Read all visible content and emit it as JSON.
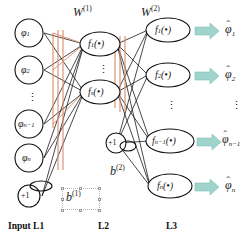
{
  "diagram": {
    "background": "#ffffff",
    "arrow_color": "#9fd4cc",
    "highlight_color": "#d98a6a",
    "edge_color": "#1a1a1a",
    "node_stroke": "#111111"
  },
  "weights": {
    "w1": {
      "base": "W",
      "sup": "(1)"
    },
    "w2": {
      "base": "W",
      "sup": "(2)"
    }
  },
  "biases": {
    "b1": {
      "base": "b",
      "sup": "(1)",
      "selected": true
    },
    "b2": {
      "base": "b",
      "sup": "(2)",
      "selected": false
    },
    "bias_value": "+1"
  },
  "layers": [
    {
      "id": "L1",
      "label": "Input L1",
      "nodes": [
        {
          "base": "φ",
          "sub": "1",
          "shape": "circle"
        },
        {
          "base": "φ",
          "sub": "2",
          "shape": "circle"
        },
        {
          "base": "⋮",
          "sub": "",
          "shape": "dots"
        },
        {
          "base": "φ",
          "sub": "n−1",
          "shape": "circle"
        },
        {
          "base": "φ",
          "sub": "n",
          "shape": "circle"
        },
        {
          "base": "+1",
          "sub": "",
          "shape": "circle-bias"
        }
      ]
    },
    {
      "id": "L2",
      "label": "L2",
      "nodes": [
        {
          "base": "f",
          "sub": "1",
          "arg": "(•)",
          "shape": "ellipse"
        },
        {
          "base": "⋮",
          "sub": "",
          "shape": "dots"
        },
        {
          "base": "f",
          "sub": "s",
          "arg": "(•)",
          "shape": "ellipse"
        },
        {
          "base": "+1",
          "sub": "",
          "shape": "circle-bias"
        }
      ]
    },
    {
      "id": "L3",
      "label": "L3",
      "nodes": [
        {
          "base": "f",
          "sub": "1",
          "arg": "(•)",
          "shape": "ellipse"
        },
        {
          "base": "f",
          "sub": "2",
          "arg": "(•)",
          "shape": "ellipse"
        },
        {
          "base": "⋮",
          "sub": "",
          "shape": "dots"
        },
        {
          "base": "f",
          "sub": "n−1",
          "arg": "(•)",
          "shape": "ellipse"
        },
        {
          "base": "f",
          "sub": "n",
          "arg": "(•)",
          "shape": "ellipse"
        }
      ]
    }
  ],
  "outputs": [
    {
      "base": "φ",
      "hat": "ˆ",
      "sub": "1"
    },
    {
      "base": "φ",
      "hat": "ˆ",
      "sub": "2"
    },
    {
      "base": "⋮",
      "hat": "",
      "sub": ""
    },
    {
      "base": "φ",
      "hat": "ˆ",
      "sub": "n−1"
    },
    {
      "base": "φ",
      "hat": "ˆ",
      "sub": "n"
    }
  ],
  "layer_labels": {
    "l1": "Input L1",
    "l2": "L2",
    "l3": "L3"
  },
  "dots": {
    "glyph": "⋮"
  }
}
